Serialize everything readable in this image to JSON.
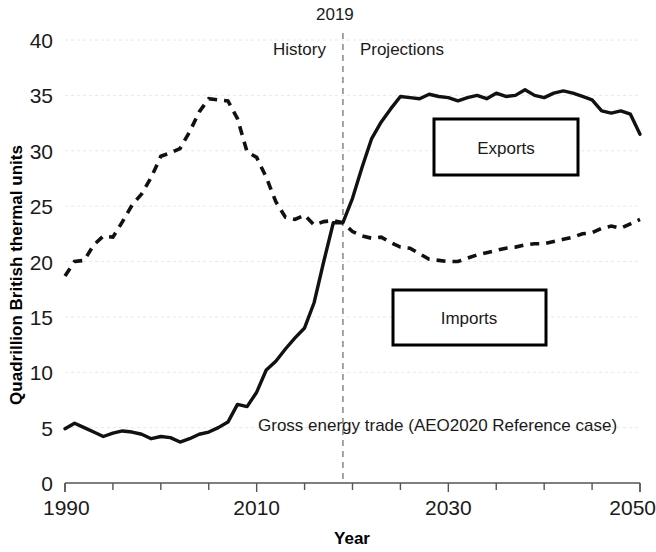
{
  "chart_data": {
    "type": "line",
    "title": "",
    "subtitle": "",
    "annotation": "Gross energy trade (AEO2020 Reference case)",
    "xlabel": "Year",
    "ylabel": "Quadrillion British thermal units",
    "xlim": [
      1990,
      2050
    ],
    "ylim": [
      0,
      40
    ],
    "xticks": [
      1990,
      2010,
      2030,
      2050
    ],
    "xtick_labels": [
      "1990",
      "2010",
      "2030",
      "2050"
    ],
    "xminorticks": [
      1995,
      2000,
      2005,
      2015,
      2020,
      2025,
      2035,
      2040,
      2045
    ],
    "yticks": [
      0,
      5,
      10,
      15,
      20,
      25,
      30,
      35,
      40
    ],
    "ytick_labels": [
      "0",
      "5",
      "10",
      "15",
      "20",
      "25",
      "30",
      "35",
      "40"
    ],
    "grid": true,
    "grid_axis": "y",
    "legend_position": "inside-right",
    "divider": {
      "x": 2019,
      "label": "2019",
      "left_label": "History",
      "right_label": "Projections",
      "style": "dashed"
    },
    "series": [
      {
        "name": "Exports",
        "style": "solid",
        "color": "#111111",
        "x": [
          1990,
          1991,
          1992,
          1993,
          1994,
          1995,
          1996,
          1997,
          1998,
          1999,
          2000,
          2001,
          2002,
          2003,
          2004,
          2005,
          2006,
          2007,
          2008,
          2009,
          2010,
          2011,
          2012,
          2013,
          2014,
          2015,
          2016,
          2017,
          2018,
          2019,
          2020,
          2021,
          2022,
          2023,
          2024,
          2025,
          2026,
          2027,
          2028,
          2029,
          2030,
          2031,
          2032,
          2033,
          2034,
          2035,
          2036,
          2037,
          2038,
          2039,
          2040,
          2041,
          2042,
          2043,
          2044,
          2045,
          2046,
          2047,
          2048,
          2049,
          2050
        ],
        "values": [
          4.9,
          5.4,
          5.0,
          4.6,
          4.2,
          4.5,
          4.7,
          4.6,
          4.4,
          4.0,
          4.2,
          4.1,
          3.7,
          4.0,
          4.4,
          4.6,
          5.0,
          5.5,
          7.1,
          6.9,
          8.2,
          10.2,
          11.0,
          12.1,
          13.1,
          14.0,
          16.3,
          20.0,
          23.5,
          23.5,
          25.7,
          28.5,
          31.1,
          32.6,
          33.8,
          34.9,
          34.8,
          34.7,
          35.1,
          34.9,
          34.8,
          34.5,
          34.8,
          35.0,
          34.7,
          35.2,
          34.9,
          35.0,
          35.5,
          35.0,
          34.8,
          35.2,
          35.4,
          35.2,
          34.9,
          34.6,
          33.6,
          33.4,
          33.6,
          33.3,
          31.5
        ]
      },
      {
        "name": "Imports",
        "style": "dashed",
        "color": "#111111",
        "x": [
          1990,
          1991,
          1992,
          1993,
          1994,
          1995,
          1996,
          1997,
          1998,
          1999,
          2000,
          2001,
          2002,
          2003,
          2004,
          2005,
          2006,
          2007,
          2008,
          2009,
          2010,
          2011,
          2012,
          2013,
          2014,
          2015,
          2016,
          2017,
          2018,
          2019,
          2020,
          2021,
          2022,
          2023,
          2024,
          2025,
          2026,
          2027,
          2028,
          2029,
          2030,
          2031,
          2032,
          2033,
          2034,
          2035,
          2036,
          2037,
          2038,
          2039,
          2040,
          2041,
          2042,
          2043,
          2044,
          2045,
          2046,
          2047,
          2048,
          2049,
          2050
        ],
        "values": [
          18.7,
          20.0,
          20.1,
          21.5,
          22.3,
          22.2,
          23.6,
          25.1,
          26.1,
          27.6,
          29.5,
          29.8,
          30.2,
          31.7,
          33.5,
          34.7,
          34.6,
          34.5,
          32.9,
          29.9,
          29.4,
          27.6,
          25.4,
          24.0,
          23.8,
          24.2,
          23.3,
          23.6,
          23.7,
          23.5,
          22.7,
          22.3,
          22.1,
          22.2,
          21.7,
          21.3,
          21.2,
          20.7,
          20.2,
          20.1,
          20.0,
          20.0,
          20.3,
          20.6,
          20.8,
          21.0,
          21.2,
          21.3,
          21.5,
          21.6,
          21.6,
          21.8,
          22.0,
          22.2,
          22.5,
          22.6,
          23.0,
          23.2,
          23.0,
          23.4,
          23.8
        ]
      }
    ]
  }
}
